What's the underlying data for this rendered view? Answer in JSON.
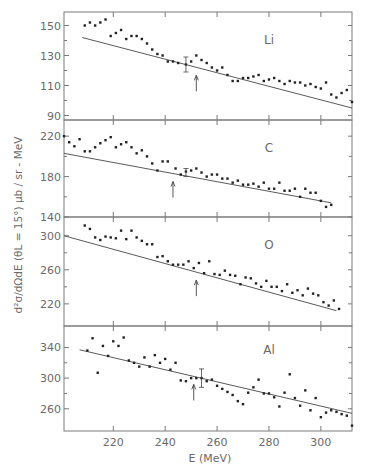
{
  "chart_data": {
    "type": "scatter",
    "title": "",
    "xlabel": "E  (MeV)",
    "ylabel": "d²σ/dΩdE  (θL = 15°)  μb / sr - MeV",
    "xlim": [
      201,
      312
    ],
    "x_ticks": [
      220,
      240,
      260,
      280,
      300
    ],
    "grid": false,
    "legend": "none",
    "panels": [
      {
        "label": "Li",
        "ylim": [
          87,
          159
        ],
        "y_ticks": [
          90,
          110,
          130,
          150
        ],
        "fit_line": {
          "x": [
            208,
            312
          ],
          "y": [
            142,
            95
          ]
        },
        "arrow_E": 252,
        "error_bar": {
          "E": 248,
          "y": 124,
          "err": 5
        },
        "x": [
          209,
          211,
          213,
          215,
          217,
          219,
          221,
          223,
          225,
          227,
          229,
          231,
          233,
          235,
          237,
          239,
          241,
          243,
          245,
          248,
          250,
          252,
          254,
          256,
          258,
          260,
          262,
          264,
          266,
          268,
          270,
          272,
          274,
          276,
          278,
          280,
          282,
          284,
          286,
          288,
          290,
          292,
          294,
          296,
          298,
          300,
          302,
          304,
          306,
          308,
          310,
          312
        ],
        "y": [
          150,
          152,
          150,
          152,
          154,
          143,
          145,
          147,
          141,
          143,
          143,
          141,
          138,
          134,
          131,
          130,
          126,
          126,
          125,
          124,
          126,
          130,
          127,
          125,
          122,
          120,
          122,
          117,
          113,
          113,
          115,
          115,
          116,
          117,
          113,
          114,
          115,
          113,
          111,
          113,
          112,
          112,
          110,
          111,
          109,
          108,
          112,
          104,
          102,
          105,
          107,
          99
        ]
      },
      {
        "label": "C",
        "ylim": [
          140,
          236
        ],
        "y_ticks": [
          140,
          180,
          220
        ],
        "fit_line": {
          "x": [
            201,
            304
          ],
          "y": [
            203,
            154
          ]
        },
        "arrow_E": 243,
        "error_bar": {
          "E": 248,
          "y": 184,
          "err": 4
        },
        "x": [
          201,
          203,
          205,
          207,
          209,
          211,
          213,
          215,
          217,
          219,
          221,
          223,
          225,
          227,
          229,
          231,
          233,
          235,
          237,
          239,
          241,
          244,
          246,
          248,
          250,
          252,
          254,
          256,
          258,
          260,
          262,
          264,
          266,
          268,
          270,
          272,
          274,
          276,
          278,
          280,
          282,
          284,
          286,
          288,
          290,
          292,
          294,
          296,
          298,
          300,
          302,
          304
        ],
        "y": [
          220,
          214,
          210,
          217,
          205,
          205,
          209,
          213,
          216,
          219,
          209,
          212,
          214,
          209,
          203,
          206,
          200,
          193,
          186,
          195,
          195,
          188,
          182,
          185,
          186,
          188,
          184,
          180,
          182,
          182,
          178,
          178,
          174,
          176,
          172,
          172,
          173,
          170,
          174,
          168,
          168,
          174,
          166,
          166,
          168,
          160,
          168,
          164,
          164,
          156,
          150,
          152
        ]
      },
      {
        "label": "O",
        "ylim": [
          194,
          322
        ],
        "y_ticks": [
          220,
          260,
          300
        ],
        "fit_line": {
          "x": [
            201,
            306
          ],
          "y": [
            300,
            212
          ]
        },
        "arrow_E": 252,
        "x": [
          209,
          211,
          213,
          215,
          217,
          219,
          221,
          223,
          225,
          227,
          229,
          231,
          233,
          235,
          237,
          239,
          241,
          243,
          245,
          247,
          249,
          251,
          253,
          255,
          257,
          259,
          261,
          263,
          265,
          267,
          269,
          271,
          273,
          275,
          277,
          279,
          281,
          283,
          285,
          287,
          289,
          291,
          293,
          295,
          297,
          299,
          301,
          303,
          305,
          307
        ],
        "y": [
          312,
          308,
          298,
          295,
          299,
          298,
          297,
          306,
          296,
          306,
          298,
          294,
          290,
          290,
          275,
          276,
          270,
          266,
          266,
          266,
          270,
          262,
          268,
          256,
          270,
          255,
          254,
          259,
          254,
          253,
          243,
          251,
          250,
          244,
          240,
          247,
          240,
          240,
          235,
          243,
          233,
          236,
          230,
          238,
          232,
          230,
          222,
          218,
          224,
          214
        ]
      },
      {
        "label": "Al",
        "ylim": [
          231,
          368
        ],
        "y_ticks": [
          260,
          300,
          340
        ],
        "fit_line": {
          "x": [
            207,
            312
          ],
          "y": [
            337,
            254
          ]
        },
        "arrow_E": 251,
        "error_bar": {
          "E": 254,
          "y": 300,
          "err": 12
        },
        "x": [
          210,
          212,
          214,
          216,
          218,
          220,
          222,
          224,
          226,
          228,
          230,
          232,
          234,
          236,
          238,
          240,
          242,
          244,
          246,
          248,
          250,
          252,
          254,
          256,
          258,
          260,
          262,
          264,
          266,
          268,
          270,
          272,
          274,
          276,
          278,
          280,
          282,
          284,
          286,
          288,
          290,
          292,
          294,
          296,
          298,
          300,
          302,
          304,
          306,
          308,
          310,
          312
        ],
        "y": [
          336,
          352,
          307,
          342,
          329,
          348,
          342,
          353,
          323,
          320,
          315,
          327,
          315,
          330,
          320,
          325,
          311,
          320,
          297,
          296,
          300,
          300,
          300,
          296,
          298,
          290,
          286,
          282,
          278,
          270,
          266,
          281,
          288,
          298,
          280,
          280,
          275,
          263,
          281,
          305,
          274,
          264,
          284,
          258,
          274,
          249,
          255,
          258,
          256,
          253,
          251,
          238
        ]
      }
    ]
  }
}
